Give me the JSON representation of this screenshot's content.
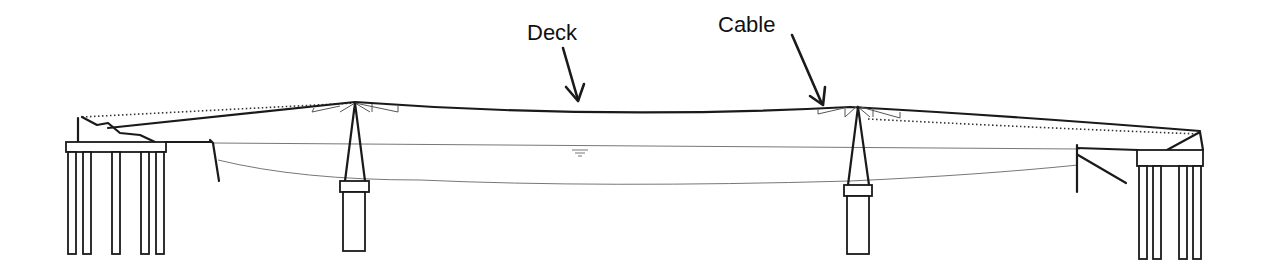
{
  "diagram": {
    "type": "bridge-elevation",
    "labels": {
      "deck": "Deck",
      "cable": "Cable"
    },
    "colors": {
      "line": "#1a1a1a",
      "thin_line": "#777777",
      "background": "#ffffff"
    },
    "components": {
      "left_abutment": {
        "piles": 5
      },
      "left_tower": {
        "type": "A-frame pylon on pier"
      },
      "right_tower": {
        "type": "A-frame pylon on pier"
      },
      "right_abutment": {
        "piles": 4
      },
      "water_level_symbol": "▽"
    }
  }
}
